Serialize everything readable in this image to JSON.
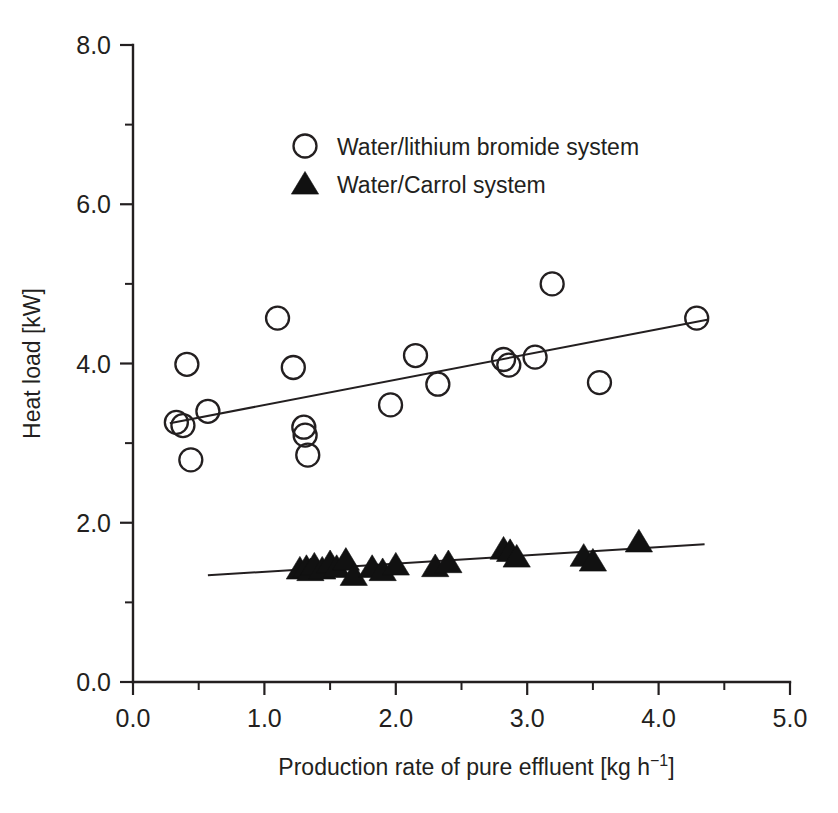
{
  "chart_data": {
    "type": "scatter",
    "title": "",
    "xlabel": "Production rate of pure effluent [kg h⁻¹]",
    "xlabel_main": "Production rate of pure effluent [kg h",
    "xlabel_sup": "−1",
    "xlabel_tail": "]",
    "ylabel": "Heat load [kW]",
    "xlim": [
      0.0,
      5.0
    ],
    "ylim": [
      0.0,
      8.0
    ],
    "xticks": [
      0.0,
      1.0,
      2.0,
      3.0,
      4.0,
      5.0
    ],
    "xticklabels": [
      "0.0",
      "1.0",
      "2.0",
      "3.0",
      "4.0",
      "5.0"
    ],
    "xminorticks": [
      0.5,
      1.5,
      2.5,
      3.5,
      4.5
    ],
    "yticks": [
      0.0,
      2.0,
      4.0,
      6.0,
      8.0
    ],
    "yticklabels": [
      "0.0",
      "2.0",
      "4.0",
      "6.0",
      "8.0"
    ],
    "yminorticks": [
      1.0,
      3.0,
      5.0,
      7.0
    ],
    "grid": false,
    "legend_position": "upper-center",
    "marker_color": "#231f20",
    "series": [
      {
        "name": "Water/lithium bromide system",
        "marker": "open-circle",
        "color": "#231f20",
        "points": [
          [
            0.33,
            3.26
          ],
          [
            0.38,
            3.22
          ],
          [
            0.41,
            3.99
          ],
          [
            0.44,
            2.79
          ],
          [
            0.57,
            3.4
          ],
          [
            1.1,
            4.57
          ],
          [
            1.22,
            3.95
          ],
          [
            1.3,
            3.2
          ],
          [
            1.31,
            3.1
          ],
          [
            1.33,
            2.85
          ],
          [
            1.96,
            3.48
          ],
          [
            2.15,
            4.1
          ],
          [
            2.32,
            3.74
          ],
          [
            2.82,
            4.05
          ],
          [
            2.86,
            3.98
          ],
          [
            3.06,
            4.08
          ],
          [
            3.19,
            5.0
          ],
          [
            3.55,
            3.76
          ],
          [
            4.29,
            4.57
          ]
        ],
        "trendline": {
          "x": [
            0.28,
            4.37
          ],
          "y": [
            3.25,
            4.55
          ]
        }
      },
      {
        "name": "Water/Carrol system",
        "marker": "filled-triangle",
        "color": "#111111",
        "points": [
          [
            1.27,
            1.42
          ],
          [
            1.32,
            1.44
          ],
          [
            1.35,
            1.4
          ],
          [
            1.38,
            1.47
          ],
          [
            1.44,
            1.42
          ],
          [
            1.5,
            1.5
          ],
          [
            1.55,
            1.44
          ],
          [
            1.62,
            1.53
          ],
          [
            1.68,
            1.34
          ],
          [
            1.82,
            1.44
          ],
          [
            1.9,
            1.4
          ],
          [
            2.0,
            1.47
          ],
          [
            2.3,
            1.45
          ],
          [
            2.4,
            1.5
          ],
          [
            2.82,
            1.67
          ],
          [
            2.87,
            1.64
          ],
          [
            2.92,
            1.57
          ],
          [
            3.43,
            1.58
          ],
          [
            3.5,
            1.52
          ],
          [
            3.85,
            1.76
          ]
        ],
        "trendline": {
          "x": [
            0.57,
            4.35
          ],
          "y": [
            1.34,
            1.73
          ]
        }
      }
    ],
    "legend": [
      {
        "label": "Water/lithium bromide system",
        "marker": "open-circle"
      },
      {
        "label": "Water/Carrol system",
        "marker": "filled-triangle"
      }
    ]
  }
}
